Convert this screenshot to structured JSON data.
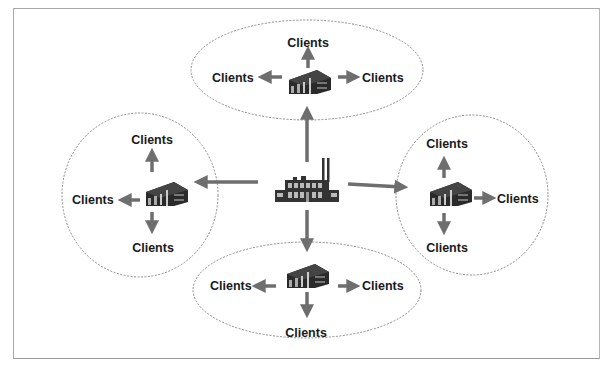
{
  "diagram": {
    "type": "hub-and-spoke distribution",
    "center": {
      "icon": "factory-icon",
      "label": ""
    },
    "clusters": [
      {
        "id": "top",
        "icon": "warehouse-icon",
        "labels": {
          "up": "Clients",
          "left": "Clients",
          "right": "Clients"
        }
      },
      {
        "id": "left",
        "icon": "warehouse-icon",
        "labels": {
          "up": "Clients",
          "left": "Clients",
          "down": "Clients"
        }
      },
      {
        "id": "right",
        "icon": "warehouse-icon",
        "labels": {
          "up": "Clients",
          "right": "Clients",
          "down": "Clients"
        }
      },
      {
        "id": "bottom",
        "icon": "warehouse-icon",
        "labels": {
          "left": "Clients",
          "right": "Clients",
          "down": "Clients"
        }
      }
    ],
    "colors": {
      "arrow": "#6e6e6e",
      "ellipse_border": "#8a8a8a",
      "frame": "#a9a9a9",
      "text": "#1a1a1a",
      "icon": "#2a2a2a"
    }
  }
}
